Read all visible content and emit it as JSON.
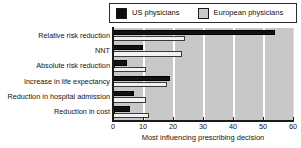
{
  "chart_data": {
    "type": "bar",
    "orientation": "horizontal",
    "title": "",
    "xlabel": "Most influencing prescribing decision",
    "ylabel": "",
    "xlim": [
      0,
      60
    ],
    "xticks": [
      0,
      10,
      20,
      30,
      40,
      50,
      60
    ],
    "grid": true,
    "grid_axis": "x",
    "legend_position": "top",
    "categories": [
      "Relative risk reduction",
      "NNT",
      "Absolute risk reduction",
      "Increase in life expectancy",
      "Reduction in hospital admission",
      "Reduction in cost"
    ],
    "series": [
      {
        "name": "US physicians",
        "color": "#121212",
        "values": [
          54,
          10,
          4.5,
          19,
          7,
          5.5
        ]
      },
      {
        "name": "European physicians",
        "color": "#f2f2f2",
        "values": [
          24,
          23,
          11,
          18,
          11,
          12
        ]
      }
    ]
  },
  "legend": {
    "entries": [
      {
        "label": "US physicians",
        "swatch": "black-square-swatch"
      },
      {
        "label": "European physicians",
        "swatch": "grey-square-swatch"
      }
    ]
  },
  "colors": {
    "plot_background": "#c8c8c8",
    "gridline": "#ffffff",
    "axis": "#1a1a1a",
    "us_bar": "#121212",
    "eu_bar": "#f2f2f2",
    "page_background": "#ffffff"
  }
}
